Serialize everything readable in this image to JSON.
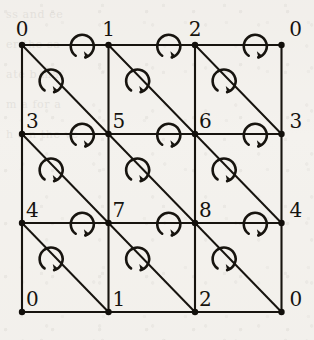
{
  "figure": {
    "kind": "triangulated-grid",
    "background_color": "#f4f2ee",
    "ink_color": "#17140f",
    "grid": {
      "columns": 3,
      "rows": 3,
      "left": 22,
      "top": 45,
      "cell_width": 86.5,
      "cell_height": 89
    },
    "diagonal_direction": "top-left-to-bottom-right",
    "arrow_orientation": "clockwise",
    "arrows_per_cell": 2
  },
  "labels": {
    "top": [
      {
        "text": "0",
        "col": 0
      },
      {
        "text": "1",
        "col": 1
      },
      {
        "text": "2",
        "col": 2
      },
      {
        "text": "0",
        "col": 3
      }
    ],
    "middle_upper": [
      {
        "text": "3",
        "col": 0
      },
      {
        "text": "5",
        "col": 1
      },
      {
        "text": "6",
        "col": 2
      },
      {
        "text": "3",
        "col": 3
      }
    ],
    "middle_lower": [
      {
        "text": "4",
        "col": 0
      },
      {
        "text": "7",
        "col": 1
      },
      {
        "text": "8",
        "col": 2
      },
      {
        "text": "4",
        "col": 3
      }
    ],
    "bottom": [
      {
        "text": "0",
        "col": 0
      },
      {
        "text": "1",
        "col": 1
      },
      {
        "text": "2",
        "col": 2
      },
      {
        "text": "0",
        "col": 3
      }
    ]
  },
  "ghost_text": {
    "lines": [
      "",
      "",
      "",
      "ss   and   ee",
      "",
      "er   the   sa",
      "",
      "ate   b   ma",
      "",
      "m a   for   a",
      "",
      "h  a  n   the   ve",
      ""
    ]
  }
}
